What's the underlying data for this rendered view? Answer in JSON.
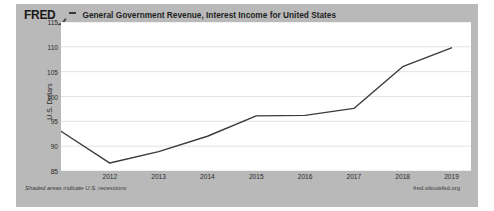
{
  "header": {
    "logo": "FRED",
    "logo_mark_icon": "fred-swoosh-icon",
    "separator": "—",
    "title": "General Government Revenue, Interest Income for United States"
  },
  "footer": {
    "left_note": "Shaded areas indicate U.S. recessions",
    "source": "fred.stlouisfed.org"
  },
  "colors": {
    "card_background": "#b9b9b9",
    "plot_background": "#ffffff",
    "line": "#3b3b3b",
    "gridline": "#dcdcdc",
    "text": "#2b2b2b"
  },
  "chart_data": {
    "type": "line",
    "title": "General Government Revenue, Interest Income for United States",
    "xlabel": "",
    "ylabel": "U.S. Dollars",
    "ylim": [
      85,
      115
    ],
    "xlim": [
      2011,
      2019.4
    ],
    "yticks": [
      85,
      90,
      95,
      100,
      105,
      110,
      115
    ],
    "xticks": [
      2012,
      2013,
      2014,
      2015,
      2016,
      2017,
      2018,
      2019
    ],
    "grid": true,
    "legend": null,
    "series": [
      {
        "name": "General Government Revenue, Interest Income for United States",
        "color": "#3b3b3b",
        "x": [
          2011,
          2012,
          2013,
          2014,
          2015,
          2016,
          2017,
          2018,
          2019
        ],
        "values": [
          93.0,
          86.6,
          88.9,
          92.0,
          96.1,
          96.2,
          97.6,
          106.0,
          109.8
        ]
      }
    ]
  }
}
